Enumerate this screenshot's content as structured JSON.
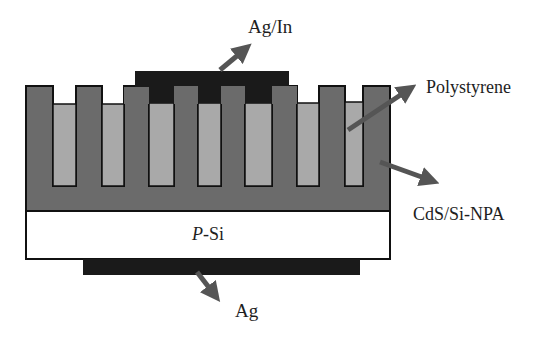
{
  "diagram": {
    "colors": {
      "background": "#ffffff",
      "nanopillar": "#6b6b6b",
      "polystyrene": "#a9a9a9",
      "electrode": "#1a1a1a",
      "substrate": "#ffffff",
      "outline": "#111111",
      "arrow": "#555555"
    },
    "layers": {
      "top_electrode": {
        "label": "Ag/In"
      },
      "filler": {
        "label": "Polystyrene"
      },
      "nanopillar_array": {
        "label": "CdS/Si-NPA"
      },
      "substrate": {
        "label_italic": "P",
        "label_rest": "-Si"
      },
      "bottom_electrode": {
        "label": "Ag"
      }
    },
    "pillars": [
      {
        "x0": 26,
        "x1": 53
      },
      {
        "x0": 76,
        "x1": 102
      },
      {
        "x0": 124,
        "x1": 149
      },
      {
        "x0": 174,
        "x1": 198
      },
      {
        "x0": 221,
        "x1": 245
      },
      {
        "x0": 272,
        "x1": 297
      },
      {
        "x0": 319,
        "x1": 345
      },
      {
        "x0": 363,
        "x1": 390
      }
    ],
    "pillar_count": 8
  }
}
